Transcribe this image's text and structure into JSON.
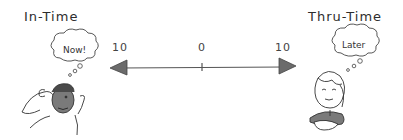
{
  "diagram": {
    "left": {
      "title": "In-Time",
      "thought": "Now!",
      "character": "man-leaning-back-hands-behind-head"
    },
    "right": {
      "title": "Thru-Time",
      "thought": "Later",
      "character": "woman-with-closed-eyes-arms-folded"
    },
    "scale": {
      "left_value": "10",
      "center_value": "0",
      "right_value": "10",
      "left_arrow": "arrow-left",
      "right_arrow": "arrow-right"
    },
    "colors": {
      "line": "#555555",
      "arrowhead": "#6b6b6b",
      "ink": "#333333",
      "shading": "#7a7a7a"
    }
  }
}
